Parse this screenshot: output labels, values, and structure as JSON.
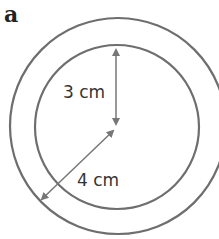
{
  "panel_label": "a",
  "diagram": {
    "type": "concentric-circles",
    "inner_radius_label": "3 cm",
    "outer_radius_label": "4 cm",
    "colors": {
      "stroke": "#6e6e6e",
      "text": "#333333"
    }
  }
}
